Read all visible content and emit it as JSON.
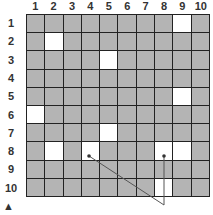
{
  "columns": [
    "1",
    "2",
    "3",
    "4",
    "5",
    "6",
    "7",
    "8",
    "9",
    "10"
  ],
  "rows": [
    "1",
    "2",
    "3",
    "4",
    "5",
    "6",
    "7",
    "8",
    "9",
    "10"
  ],
  "white_cells": [
    [
      1,
      9
    ],
    [
      2,
      2
    ],
    [
      3,
      5
    ],
    [
      5,
      9
    ],
    [
      6,
      1
    ],
    [
      7,
      5
    ],
    [
      8,
      2
    ],
    [
      8,
      4
    ],
    [
      8,
      8
    ],
    [
      8,
      9
    ],
    [
      10,
      8
    ]
  ],
  "markers": [
    {
      "row": 8,
      "col": 4,
      "shape": "dot"
    },
    {
      "row": 8,
      "col": 8,
      "shape": "dot"
    }
  ],
  "lines": [
    {
      "from": "marker-r8c4",
      "to": "below-grid-col8"
    },
    {
      "from": "marker-r8c8",
      "to": "below-grid-col8"
    }
  ],
  "colors": {
    "cell": "#b4b4b4",
    "white": "#ffffff",
    "grid_line": "#222222"
  },
  "footer_icon": "up-arrow-icon",
  "footer_glyph": "▲"
}
